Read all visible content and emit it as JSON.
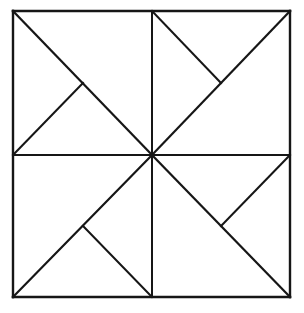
{
  "figure": {
    "name": "pinwheel-square-diagram",
    "background_color": "#ffffff",
    "line_color": "#161616",
    "canvas": {
      "width": 304,
      "height": 313
    },
    "square": {
      "left": 13,
      "top": 11,
      "right": 290,
      "bottom": 297,
      "width": 277,
      "height": 286
    },
    "center_point": {
      "x": 152,
      "y": 155
    },
    "vertices": {
      "top_left": {
        "x": 13,
        "y": 11
      },
      "top_mid": {
        "x": 152,
        "y": 11
      },
      "top_right": {
        "x": 290,
        "y": 11
      },
      "left_mid": {
        "x": 13,
        "y": 155
      },
      "center": {
        "x": 152,
        "y": 155
      },
      "right_mid": {
        "x": 290,
        "y": 155
      },
      "bottom_left": {
        "x": 13,
        "y": 297
      },
      "bottom_mid": {
        "x": 152,
        "y": 297
      },
      "bottom_right": {
        "x": 290,
        "y": 297
      }
    },
    "junctions": {
      "top_left_quadrant": {
        "x": 83,
        "y": 83
      },
      "top_right_quadrant": {
        "x": 221,
        "y": 83
      },
      "bottom_left_quadrant": {
        "x": 83,
        "y": 226
      },
      "bottom_right_quadrant": {
        "x": 221,
        "y": 226
      }
    },
    "outer_edges": [
      {
        "name": "top-edge",
        "x1": 13,
        "y1": 11,
        "x2": 290,
        "y2": 11
      },
      {
        "name": "right-edge",
        "x1": 290,
        "y1": 11,
        "x2": 290,
        "y2": 297
      },
      {
        "name": "bottom-edge",
        "x1": 290,
        "y1": 297,
        "x2": 13,
        "y2": 297
      },
      {
        "name": "left-edge",
        "x1": 13,
        "y1": 297,
        "x2": 13,
        "y2": 11
      }
    ],
    "midlines": [
      {
        "name": "horizontal-midline",
        "x1": 13,
        "y1": 155,
        "x2": 290,
        "y2": 155
      },
      {
        "name": "vertical-midline",
        "x1": 152,
        "y1": 11,
        "x2": 152,
        "y2": 297
      }
    ],
    "quadrant_diagonals": [
      {
        "name": "diagonal-top-left",
        "x1": 13,
        "y1": 11,
        "x2": 152,
        "y2": 155
      },
      {
        "name": "diagonal-top-right",
        "x1": 152,
        "y1": 155,
        "x2": 290,
        "y2": 11
      },
      {
        "name": "diagonal-bottom-left",
        "x1": 13,
        "y1": 297,
        "x2": 152,
        "y2": 155
      },
      {
        "name": "diagonal-bottom-right",
        "x1": 152,
        "y1": 155,
        "x2": 290,
        "y2": 297
      }
    ],
    "quadrant_spokes": [
      {
        "name": "spoke-top-left",
        "x1": 13,
        "y1": 155,
        "x2": 83,
        "y2": 83
      },
      {
        "name": "spoke-top-right",
        "x1": 152,
        "y1": 11,
        "x2": 221,
        "y2": 83
      },
      {
        "name": "spoke-bottom-left",
        "x1": 152,
        "y1": 297,
        "x2": 83,
        "y2": 226
      },
      {
        "name": "spoke-bottom-right",
        "x1": 290,
        "y1": 155,
        "x2": 221,
        "y2": 226
      }
    ]
  }
}
